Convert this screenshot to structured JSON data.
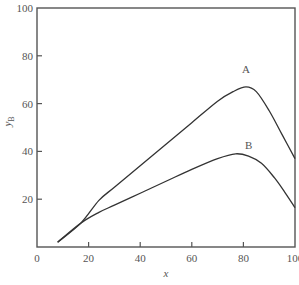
{
  "chart_data": {
    "type": "line",
    "title": "",
    "xlabel": "x",
    "ylabel": "y",
    "ylabel_subscript": "B",
    "xlim": [
      0,
      100
    ],
    "ylim": [
      0,
      100
    ],
    "xticks": [
      0,
      20,
      40,
      60,
      80,
      100
    ],
    "yticks": [
      20,
      40,
      60,
      80,
      100
    ],
    "grid": false,
    "legend": "none (curves labeled inline)",
    "series": [
      {
        "name": "A",
        "label_position": [
          81,
          73
        ],
        "x": [
          8,
          17,
          24,
          30,
          40,
          50,
          60,
          70,
          76,
          81,
          85,
          90,
          95,
          100
        ],
        "y": [
          2,
          10,
          19.5,
          25,
          34,
          43,
          52,
          61,
          65,
          67,
          65,
          57,
          47,
          37
        ]
      },
      {
        "name": "B",
        "label_position": [
          82,
          41
        ],
        "x": [
          8,
          17,
          24,
          30,
          40,
          50,
          60,
          70,
          77,
          82,
          87,
          92,
          96,
          100
        ],
        "y": [
          2,
          10,
          14.5,
          17.5,
          22.5,
          27.5,
          32.5,
          37,
          39,
          38,
          35,
          29,
          23,
          16.5
        ]
      }
    ]
  },
  "labels": {
    "x_axis": "x",
    "y_axis_main": "y",
    "y_axis_sub": "B",
    "curve_a": "A",
    "curve_b": "B"
  }
}
